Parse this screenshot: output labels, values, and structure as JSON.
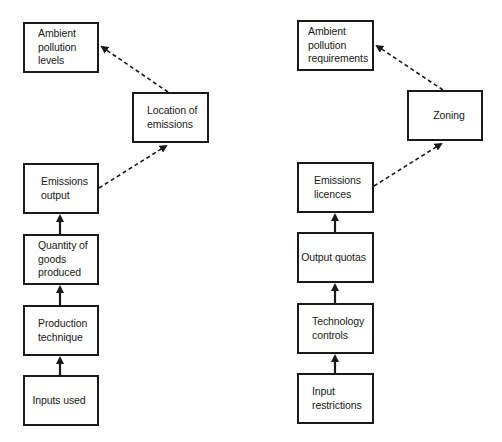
{
  "diagram": {
    "left_chain": {
      "nodes": {
        "ambient_levels": "Ambient\npollution\nlevels",
        "location": "Location of\nemissions",
        "emissions_output": "Emissions\noutput",
        "quantity": "Quantity of\ngoods\nproduced",
        "production": "Production\ntechnique",
        "inputs": "Inputs used"
      }
    },
    "right_chain": {
      "nodes": {
        "ambient_requirements": "Ambient\npollution\nrequirements",
        "zoning": "Zoning",
        "licences": "Emissions\nlicences",
        "quotas": "Output quotas",
        "technology": "Technology\ncontrols",
        "input_restrictions": "Input\nrestrictions"
      }
    },
    "edges": [
      {
        "from": "Inputs used",
        "to": "Production technique",
        "style": "solid"
      },
      {
        "from": "Production technique",
        "to": "Quantity of goods produced",
        "style": "solid"
      },
      {
        "from": "Quantity of goods produced",
        "to": "Emissions output",
        "style": "solid"
      },
      {
        "from": "Emissions output",
        "to": "Location of emissions",
        "style": "dashed"
      },
      {
        "from": "Location of emissions",
        "to": "Ambient pollution levels",
        "style": "dashed"
      },
      {
        "from": "Input restrictions",
        "to": "Technology controls",
        "style": "solid"
      },
      {
        "from": "Technology controls",
        "to": "Output quotas",
        "style": "solid"
      },
      {
        "from": "Output quotas",
        "to": "Emissions licences",
        "style": "solid"
      },
      {
        "from": "Emissions licences",
        "to": "Zoning",
        "style": "dashed"
      },
      {
        "from": "Zoning",
        "to": "Ambient pollution requirements",
        "style": "dashed"
      }
    ],
    "colors": {
      "stroke": "#1a1a1a",
      "background": "#ffffff"
    }
  }
}
